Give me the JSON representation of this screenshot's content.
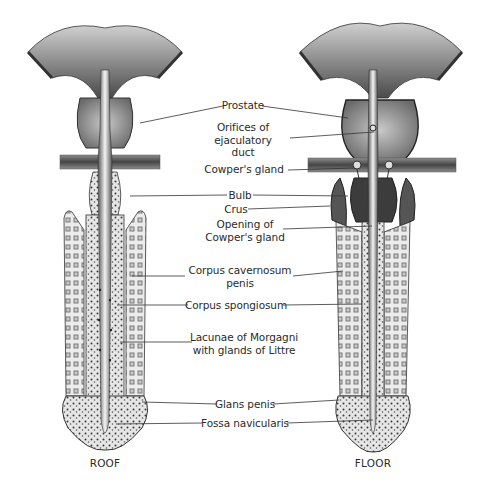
{
  "figure": {
    "views": [
      {
        "id": "roof",
        "caption": "ROOF"
      },
      {
        "id": "floor",
        "caption": "FLOOR"
      }
    ],
    "labels": [
      {
        "id": "prostate",
        "text": "Prostate"
      },
      {
        "id": "orifices",
        "text": "Orifices of\nejaculatory\nduct"
      },
      {
        "id": "cowpers-gland",
        "text": "Cowper's gland"
      },
      {
        "id": "bulb",
        "text": "Bulb"
      },
      {
        "id": "crus",
        "text": "Crus"
      },
      {
        "id": "opening-cowpers",
        "text": "Opening of\nCowper's gland"
      },
      {
        "id": "corpus-cavernosum",
        "text": "Corpus cavernosum\npenis"
      },
      {
        "id": "corpus-spongiosum",
        "text": "Corpus spongiosum"
      },
      {
        "id": "lacunae",
        "text": "Lacunae of Morgagni\nwith glands of Littre"
      },
      {
        "id": "glans",
        "text": "Glans penis"
      },
      {
        "id": "fossa",
        "text": "Fossa navicularis"
      }
    ],
    "colors": {
      "background": "#ffffff",
      "ink": "#2b2b2b",
      "tissue_dark": "#3a3a3a",
      "tissue_mid": "#8a8a8a",
      "tissue_light": "#d8d8d8"
    }
  }
}
